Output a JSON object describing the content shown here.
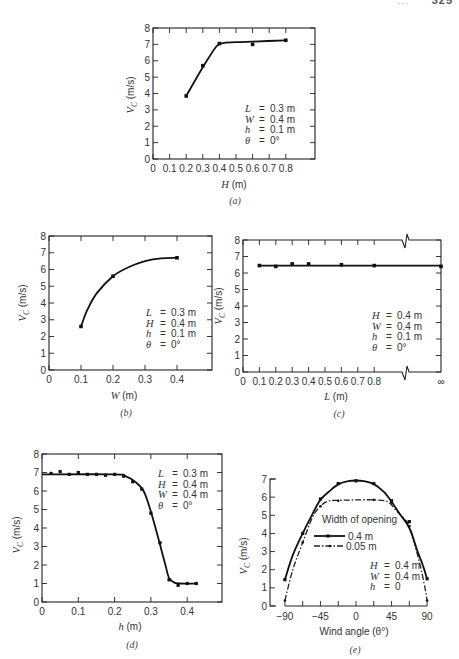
{
  "page": {
    "header_text": "...",
    "page_number": "325"
  },
  "chart_data": [
    {
      "id": "a",
      "type": "line",
      "caption": "(a)",
      "xlabel": "H  (m)",
      "ylabel": "V_C  (m/s)",
      "xlim": [
        0,
        0.8
      ],
      "ylim": [
        0,
        8
      ],
      "xticks": [
        "0",
        "0.1",
        "0.2",
        "0.3",
        "0.4",
        "0.5",
        "0.6",
        "0.7",
        "0.8"
      ],
      "yticks": [
        "0",
        "1",
        "2",
        "3",
        "4",
        "5",
        "6",
        "7",
        "8"
      ],
      "points": [
        [
          0.2,
          3.85
        ],
        [
          0.3,
          5.7
        ],
        [
          0.4,
          7.05
        ],
        [
          0.6,
          7.0
        ],
        [
          0.8,
          7.25
        ]
      ],
      "curve": [
        [
          0.2,
          3.85
        ],
        [
          0.3,
          5.6
        ],
        [
          0.38,
          6.85
        ],
        [
          0.42,
          7.08
        ],
        [
          0.5,
          7.13
        ],
        [
          0.6,
          7.17
        ],
        [
          0.8,
          7.25
        ]
      ],
      "annotations": [
        "L  =  0.3  m",
        "W  =  0.4  m",
        "h  =  0.1  m",
        "θ  =  0°"
      ],
      "grid": false
    },
    {
      "id": "b",
      "type": "line",
      "caption": "(b)",
      "xlabel": "W  (m)",
      "ylabel": "V_C  (m/s)",
      "xlim": [
        0,
        0.4
      ],
      "ylim": [
        0,
        8
      ],
      "xticks": [
        "0",
        "0.1",
        "0.2",
        "0.3",
        "0.4"
      ],
      "yticks": [
        "0",
        "1",
        "2",
        "3",
        "4",
        "5",
        "6",
        "7",
        "8"
      ],
      "points": [
        [
          0.1,
          2.6
        ],
        [
          0.2,
          5.6
        ],
        [
          0.4,
          6.7
        ]
      ],
      "curve": [
        [
          0.1,
          2.6
        ],
        [
          0.12,
          3.6
        ],
        [
          0.15,
          4.6
        ],
        [
          0.2,
          5.6
        ],
        [
          0.25,
          6.15
        ],
        [
          0.3,
          6.5
        ],
        [
          0.35,
          6.67
        ],
        [
          0.4,
          6.7
        ]
      ],
      "annotations": [
        "L  =  0.3  m",
        "H  =  0.4  m",
        "h  =  0.1  m",
        "θ  =  0°"
      ],
      "grid": false
    },
    {
      "id": "c",
      "type": "line",
      "caption": "(c)",
      "xlabel": "L  (m)",
      "ylabel": "V_C  (m/s)",
      "xlim": [
        0,
        "∞"
      ],
      "ylim": [
        0,
        8
      ],
      "xticks": [
        "0",
        "0.1",
        "0.2",
        "0.3",
        "0.4",
        "0.5",
        "0.6",
        "0.7",
        "0.8",
        "∞"
      ],
      "yticks": [
        "0",
        "1",
        "2",
        "3",
        "4",
        "5",
        "6",
        "7",
        "8"
      ],
      "points": [
        [
          0.1,
          6.45
        ],
        [
          0.2,
          6.4
        ],
        [
          0.3,
          6.55
        ],
        [
          0.4,
          6.55
        ],
        [
          0.6,
          6.5
        ],
        [
          0.8,
          6.45
        ],
        [
          "∞",
          6.4
        ]
      ],
      "axis_break": true,
      "annotations": [
        "H  =  0.4  m",
        "W  =  0.4  m",
        "h  =  0.1  m",
        "θ  =  0°"
      ],
      "grid": false
    },
    {
      "id": "d",
      "type": "line",
      "caption": "(d)",
      "xlabel": "h (m)",
      "ylabel": "V_C  (m/s)",
      "xlim": [
        0,
        0.45
      ],
      "ylim": [
        0,
        8
      ],
      "xticks": [
        "0",
        "0.1",
        "0.2",
        "0.3",
        "0.4"
      ],
      "yticks": [
        "0",
        "1",
        "2",
        "3",
        "4",
        "5",
        "6",
        "7",
        "8"
      ],
      "points": [
        [
          0.025,
          6.95
        ],
        [
          0.05,
          7.05
        ],
        [
          0.075,
          6.9
        ],
        [
          0.1,
          7.0
        ],
        [
          0.125,
          6.9
        ],
        [
          0.15,
          6.9
        ],
        [
          0.175,
          6.85
        ],
        [
          0.2,
          6.9
        ],
        [
          0.225,
          6.8
        ],
        [
          0.25,
          6.5
        ],
        [
          0.275,
          6.1
        ],
        [
          0.3,
          4.8
        ],
        [
          0.325,
          3.2
        ],
        [
          0.35,
          1.2
        ],
        [
          0.375,
          0.9
        ],
        [
          0.4,
          1.0
        ],
        [
          0.425,
          1.0
        ]
      ],
      "curve": [
        [
          0,
          6.9
        ],
        [
          0.2,
          6.9
        ],
        [
          0.23,
          6.8
        ],
        [
          0.26,
          6.45
        ],
        [
          0.28,
          6.0
        ],
        [
          0.295,
          5.2
        ],
        [
          0.31,
          4.2
        ],
        [
          0.325,
          3.1
        ],
        [
          0.34,
          2.0
        ],
        [
          0.35,
          1.3
        ],
        [
          0.365,
          1.05
        ],
        [
          0.38,
          1.0
        ],
        [
          0.425,
          1.0
        ]
      ],
      "annotations": [
        "L  =  0.3  m",
        "H  =  0.4  m",
        "W  =  0.4  m",
        "θ  =  0°"
      ],
      "grid": false
    },
    {
      "id": "e",
      "type": "line",
      "caption": "(e)",
      "xlabel": "Wind angle (θ°)",
      "ylabel": "V_C  (m/s)",
      "xlim": [
        -90,
        90
      ],
      "ylim": [
        0,
        7
      ],
      "xticks": [
        "−90",
        "−45",
        "0",
        "45",
        "90"
      ],
      "yticks": [
        "0",
        "1",
        "2",
        "3",
        "4",
        "5",
        "6",
        "7"
      ],
      "legend_title": "Width of opening",
      "series": [
        {
          "name": "0.4 m",
          "style": "solid",
          "points": [
            [
              -90,
              1.45
            ],
            [
              -67.5,
              4.0
            ],
            [
              -45,
              5.9
            ],
            [
              -22.5,
              6.75
            ],
            [
              0,
              6.9
            ],
            [
              22.5,
              6.75
            ],
            [
              45,
              5.8
            ],
            [
              67.5,
              4.65
            ],
            [
              90,
              1.5
            ]
          ],
          "curve": [
            [
              -90,
              1.45
            ],
            [
              -80,
              2.8
            ],
            [
              -67.5,
              4.0
            ],
            [
              -56,
              5.0
            ],
            [
              -45,
              5.85
            ],
            [
              -33,
              6.35
            ],
            [
              -22.5,
              6.7
            ],
            [
              -10,
              6.88
            ],
            [
              0,
              6.92
            ],
            [
              10,
              6.88
            ],
            [
              22.5,
              6.72
            ],
            [
              35,
              6.3
            ],
            [
              45,
              5.75
            ],
            [
              55,
              5.1
            ],
            [
              67.5,
              4.3
            ],
            [
              78,
              3.0
            ],
            [
              85,
              2.2
            ],
            [
              90,
              1.5
            ]
          ]
        },
        {
          "name": "0.05 m",
          "style": "dashed",
          "points": [
            [
              -90,
              0.3
            ],
            [
              -67.5,
              3.5
            ],
            [
              -45,
              5.5
            ],
            [
              -22.5,
              5.8
            ],
            [
              22.5,
              5.85
            ],
            [
              45,
              5.7
            ],
            [
              67.5,
              4.4
            ],
            [
              90,
              0.3
            ]
          ],
          "curve": [
            [
              -90,
              0.3
            ],
            [
              -80,
              2.0
            ],
            [
              -67.5,
              3.5
            ],
            [
              -55,
              4.9
            ],
            [
              -45,
              5.5
            ],
            [
              -35,
              5.78
            ],
            [
              -22.5,
              5.82
            ],
            [
              0,
              5.85
            ],
            [
              22.5,
              5.85
            ],
            [
              40,
              5.75
            ],
            [
              50,
              5.3
            ],
            [
              60,
              4.85
            ],
            [
              67.5,
              4.4
            ],
            [
              78,
              2.8
            ],
            [
              86,
              1.3
            ],
            [
              90,
              0.3
            ]
          ]
        }
      ],
      "annotations": [
        "H  =  0.4  m",
        "W  =  0.4  m",
        "h  =  0"
      ],
      "grid": false
    }
  ]
}
